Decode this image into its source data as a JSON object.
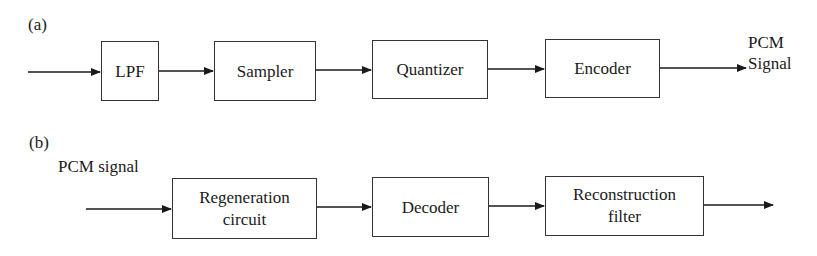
{
  "diagram_a": {
    "label": "(a)",
    "blocks": [
      {
        "id": "lpf",
        "label": "LPF"
      },
      {
        "id": "sampler",
        "label": "Sampler"
      },
      {
        "id": "quantizer",
        "label": "Quantizer"
      },
      {
        "id": "encoder",
        "label": "Encoder"
      }
    ],
    "output_label_line1": "PCM",
    "output_label_line2": "Signal"
  },
  "diagram_b": {
    "label": "(b)",
    "input_label": "PCM signal",
    "blocks": [
      {
        "id": "regeneration",
        "label_line1": "Regeneration",
        "label_line2": "circuit"
      },
      {
        "id": "decoder",
        "label": "Decoder"
      },
      {
        "id": "reconstruction",
        "label_line1": "Reconstruction",
        "label_line2": "filter"
      }
    ]
  },
  "colors": {
    "stroke": "#1a1a1a",
    "background": "#ffffff"
  }
}
